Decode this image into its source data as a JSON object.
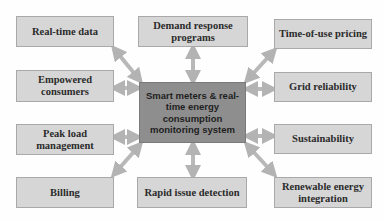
{
  "diagram": {
    "center": {
      "label": "Smart meters & real-time energy consumption monitoring system"
    },
    "nodes": [
      {
        "id": "real-time-data",
        "label": "Real-time data"
      },
      {
        "id": "demand-response-programs",
        "label": "Demand response programs"
      },
      {
        "id": "time-of-use-pricing",
        "label": "Time-of-use pricing"
      },
      {
        "id": "empowered-consumers",
        "label": "Empowered consumers"
      },
      {
        "id": "grid-reliability",
        "label": "Grid reliability"
      },
      {
        "id": "peak-load-management",
        "label": "Peak load management"
      },
      {
        "id": "sustainability",
        "label": "Sustainability"
      },
      {
        "id": "billing",
        "label": "Billing"
      },
      {
        "id": "rapid-issue-detection",
        "label": "Rapid issue detection"
      },
      {
        "id": "renewable-energy-integration",
        "label": "Renewable energy integration"
      }
    ],
    "edges": "bidirectional arrows from center to every node",
    "colors": {
      "node_fill": "#d6d6d6",
      "center_fill": "#8e8e8e",
      "arrow": "#b5b5b5"
    }
  }
}
